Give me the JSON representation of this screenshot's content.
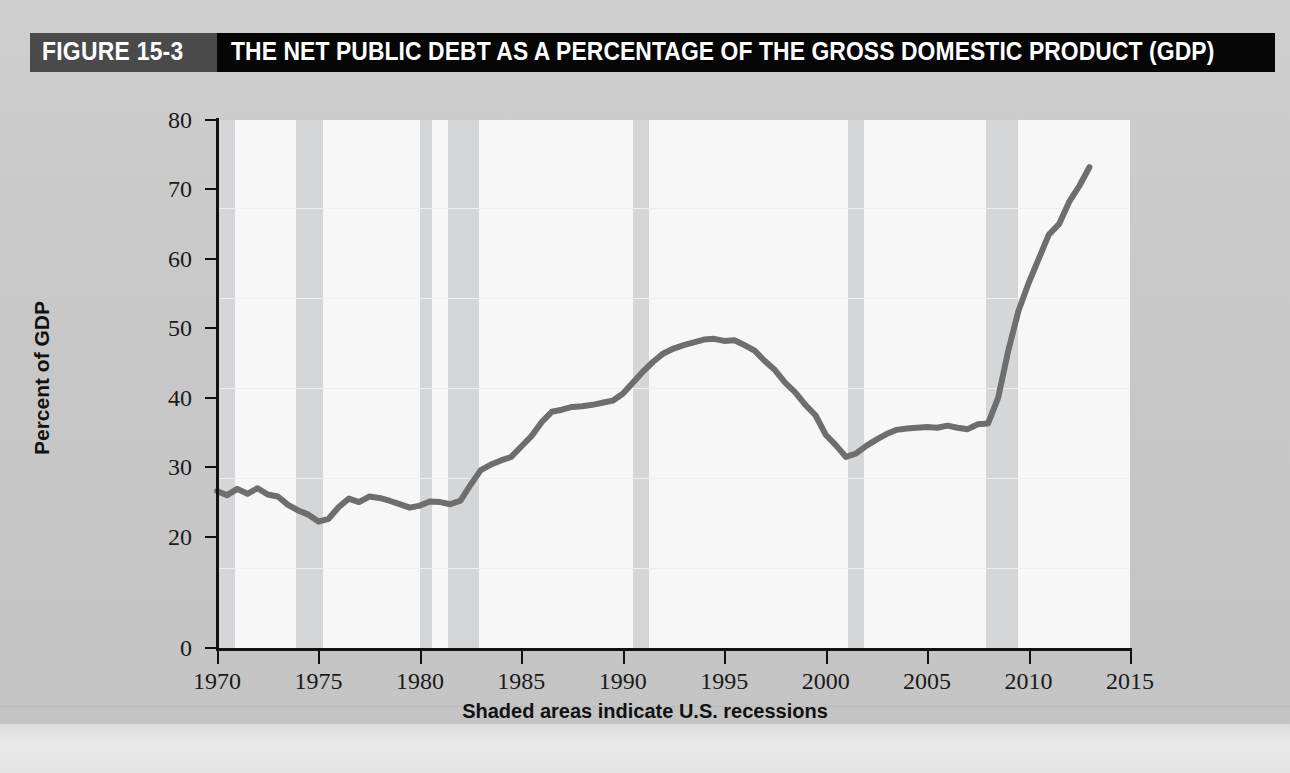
{
  "figure": {
    "number_label": "FIGURE 15-3",
    "title": "THE NET PUBLIC DEBT AS A PERCENTAGE OF THE GROSS DOMESTIC PRODUCT (GDP)",
    "footnote": "Shaded areas indicate U.S. recessions",
    "colors": {
      "number_bar": "#4a4a4a",
      "title_bar": "#050505",
      "page_background": "#c8c8c8",
      "plot_background": "#f7f7f7",
      "recession_band": "#d2d4d6",
      "line": "#6e6e6e"
    }
  },
  "chart_data": {
    "type": "line",
    "title": "THE NET PUBLIC DEBT AS A PERCENTAGE OF THE GROSS DOMESTIC PRODUCT (GDP)",
    "xlabel": "",
    "ylabel": "Percent of GDP",
    "xlim": [
      1970,
      2015
    ],
    "ylim": [
      0,
      80
    ],
    "grid": false,
    "legend": null,
    "annotation": "Shaded areas indicate U.S. recessions",
    "x_ticks": [
      1970,
      1975,
      1980,
      1985,
      1990,
      1995,
      2000,
      2005,
      2010,
      2015
    ],
    "x_tick_labels": [
      "1970",
      "1975",
      "1980",
      "1985",
      "1990",
      "1995",
      "2000",
      "2005",
      "2010",
      "2015"
    ],
    "y_ticks": [
      0,
      20,
      30,
      40,
      50,
      60,
      70,
      80
    ],
    "y_tick_labels": [
      "0",
      "20",
      "30",
      "40",
      "50",
      "60",
      "70",
      "80"
    ],
    "series": [
      {
        "name": "Net public debt as a percentage of GDP",
        "x": [
          1970.0,
          1970.5,
          1971.0,
          1971.5,
          1972.0,
          1972.5,
          1973.0,
          1973.5,
          1974.0,
          1974.5,
          1975.0,
          1975.5,
          1976.0,
          1976.5,
          1977.0,
          1977.5,
          1978.0,
          1978.5,
          1979.0,
          1979.5,
          1980.0,
          1980.5,
          1981.0,
          1981.5,
          1982.0,
          1982.5,
          1983.0,
          1983.5,
          1984.0,
          1984.5,
          1985.0,
          1985.5,
          1986.0,
          1986.5,
          1987.0,
          1987.5,
          1988.0,
          1988.5,
          1989.0,
          1989.5,
          1990.0,
          1990.5,
          1991.0,
          1991.5,
          1992.0,
          1992.5,
          1993.0,
          1993.5,
          1994.0,
          1994.5,
          1995.0,
          1995.5,
          1996.0,
          1996.5,
          1997.0,
          1997.5,
          1998.0,
          1998.5,
          1999.0,
          1999.5,
          2000.0,
          2000.5,
          2001.0,
          2001.5,
          2002.0,
          2002.5,
          2003.0,
          2003.5,
          2004.0,
          2004.5,
          2005.0,
          2005.5,
          2006.0,
          2006.5,
          2007.0,
          2007.5,
          2008.0,
          2008.5,
          2009.0,
          2009.5,
          2010.0,
          2010.5,
          2011.0,
          2011.5,
          2012.0,
          2012.5,
          2013.0
        ],
        "y": [
          26.6,
          26.0,
          26.9,
          26.2,
          27.0,
          26.1,
          25.8,
          24.6,
          23.8,
          23.2,
          22.2,
          22.6,
          24.3,
          25.5,
          25.0,
          25.8,
          25.6,
          25.2,
          24.7,
          24.2,
          24.5,
          25.1,
          25.0,
          24.7,
          25.2,
          27.5,
          29.6,
          30.4,
          31.0,
          31.5,
          33.0,
          34.5,
          36.5,
          38.0,
          38.3,
          38.7,
          38.8,
          39.0,
          39.3,
          39.6,
          40.6,
          42.2,
          43.8,
          45.2,
          46.4,
          47.1,
          47.6,
          48.0,
          48.4,
          48.5,
          48.2,
          48.3,
          47.6,
          46.8,
          45.3,
          44.0,
          42.2,
          40.8,
          39.0,
          37.5,
          34.7,
          33.2,
          31.5,
          32.0,
          33.1,
          34.0,
          34.8,
          35.4,
          35.6,
          35.7,
          35.8,
          35.7,
          36.0,
          35.7,
          35.5,
          36.2,
          36.3,
          40.0,
          46.8,
          52.5,
          56.5,
          60.0,
          63.5,
          65.0,
          68.2,
          70.5,
          73.2
        ],
        "units": "percent of GDP",
        "color": "#6e6e6e"
      }
    ],
    "recession_bands": [
      {
        "start": 1969.8,
        "end": 1970.9,
        "label": "1969-70 recession"
      },
      {
        "start": 1973.9,
        "end": 1975.2,
        "label": "1973-75 recession"
      },
      {
        "start": 1980.0,
        "end": 1980.6,
        "label": "1980 recession"
      },
      {
        "start": 1981.4,
        "end": 1982.9,
        "label": "1981-82 recession"
      },
      {
        "start": 1990.5,
        "end": 1991.3,
        "label": "1990-91 recession"
      },
      {
        "start": 2001.1,
        "end": 2001.9,
        "label": "2001 recession"
      },
      {
        "start": 2007.9,
        "end": 2009.5,
        "label": "2007-09 recession"
      }
    ]
  }
}
